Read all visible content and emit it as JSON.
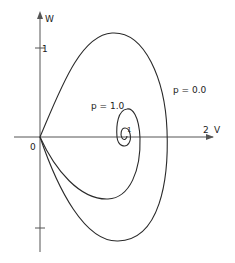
{
  "figure": {
    "axes": {
      "x_label": "V",
      "y_label": "W",
      "origin_label": "0",
      "x_tick_label": "2",
      "y_tick_label": "1",
      "center_point_label": "1"
    },
    "curves": [
      {
        "label": "p = 0.0",
        "description": "outer closed loop from origin"
      },
      {
        "label": "p = 1.0",
        "description": "inner curve spiraling into fixed point"
      }
    ],
    "colors": {
      "line": "#2a2a2a",
      "axis": "#555555",
      "background": "#ffffff"
    }
  }
}
